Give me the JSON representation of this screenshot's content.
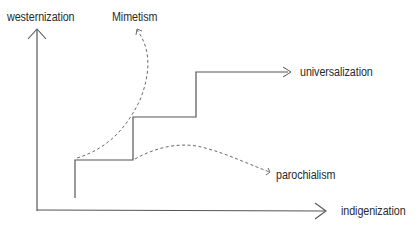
{
  "diagram": {
    "axes": {
      "y_label": "westernization",
      "x_label": "indigenization"
    },
    "labels": {
      "mimetism": "Mimetism",
      "universalization": "universalization",
      "parochialism": "parochialism"
    },
    "colors": {
      "line": "#555555",
      "dashed": "#6a6a6a",
      "text": "#2a2a2a"
    }
  }
}
